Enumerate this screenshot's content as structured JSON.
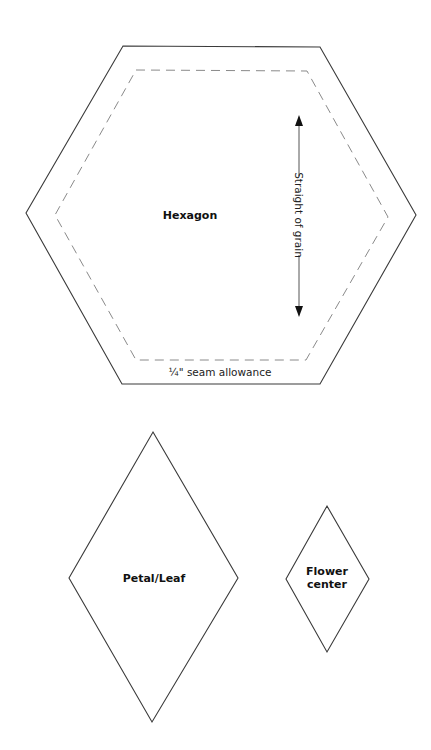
{
  "diagram": {
    "colors": {
      "background": "#ffffff",
      "outline": "#3a3a3a",
      "seam_line": "#8a8a8a",
      "text": "#111111"
    },
    "hexagon": {
      "label": "Hexagon",
      "grain_label": "Straight of grain",
      "seam_label": "¼\" seam allowance"
    },
    "petal": {
      "label": "Petal/Leaf"
    },
    "flower_center": {
      "label_line1": "Flower",
      "label_line2": "center"
    }
  }
}
